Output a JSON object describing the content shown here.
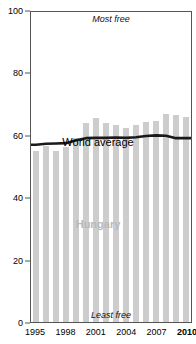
{
  "chart_data": {
    "type": "bar",
    "title": "",
    "subtitle": "",
    "xlabel": "",
    "ylabel": "",
    "ylim": [
      0,
      100
    ],
    "xlim_years": [
      1995,
      2010
    ],
    "grid": false,
    "legend_position": "inline-annotations",
    "yticks": [
      0,
      20,
      40,
      60,
      80,
      100
    ],
    "ytick_labels": [
      "0",
      "20",
      "40",
      "60",
      "80",
      "100"
    ],
    "xticks": [
      1995,
      1998,
      2001,
      2004,
      2007,
      2010
    ],
    "xtick_labels": [
      "1995",
      "1998",
      "2001",
      "2004",
      "2007",
      "2010"
    ],
    "categories": [
      "1995",
      "1996",
      "1997",
      "1998",
      "1999",
      "2000",
      "2001",
      "2002",
      "2003",
      "2004",
      "2005",
      "2006",
      "2007",
      "2008",
      "2009",
      "2010"
    ],
    "series": [
      {
        "name": "Hungary",
        "type": "bar",
        "color": "#cdcdcd",
        "values": [
          55.2,
          56.8,
          55.3,
          56.5,
          59.2,
          64.3,
          65.8,
          64.2,
          63.4,
          62.7,
          63.5,
          64.5,
          64.8,
          67.2,
          66.8,
          66.1
        ]
      },
      {
        "name": "World average",
        "type": "line",
        "color": "#1a1a1a",
        "values": [
          57.2,
          57.5,
          57.6,
          57.7,
          58.6,
          59.3,
          59.4,
          59.4,
          59.5,
          59.4,
          59.6,
          60.0,
          60.2,
          60.1,
          59.3,
          59.3
        ]
      }
    ],
    "annotations": [
      {
        "name": "most-free",
        "text": "Most free",
        "position": "top-center"
      },
      {
        "name": "least-free",
        "text": "Least free",
        "position": "bottom-center"
      },
      {
        "name": "series-label-world",
        "text": "World average",
        "position": "inline"
      },
      {
        "name": "series-label-country",
        "text": "Hungary",
        "position": "inline"
      }
    ]
  },
  "labels": {
    "title_remnant": "y",
    "most_free": "Most free",
    "least_free": "Least free",
    "world_average": "World average",
    "country": "Hungary"
  },
  "colors": {
    "bar": "#cdcdcd",
    "line": "#1a1a1a",
    "axis": "#555555",
    "country_label": "#b9b9b9",
    "background": "#ffffff"
  }
}
